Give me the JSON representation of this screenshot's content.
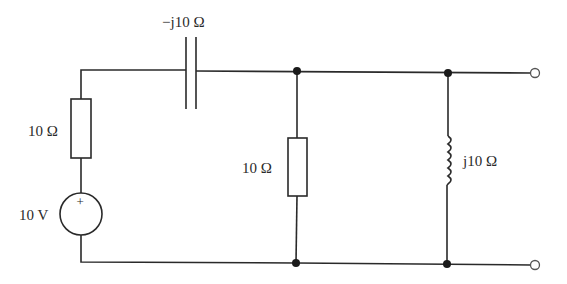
{
  "diagram": {
    "type": "circuit-schematic",
    "components": {
      "source": {
        "kind": "voltage-source",
        "label": "10 V",
        "polarity": "+"
      },
      "series_resistor": {
        "kind": "resistor",
        "label": "10 Ω"
      },
      "capacitor": {
        "kind": "capacitor",
        "label": "−j10 Ω"
      },
      "shunt_resistor": {
        "kind": "resistor",
        "label": "10 Ω"
      },
      "inductor": {
        "kind": "inductor",
        "label": "j10 Ω"
      }
    },
    "terminals": {
      "count": 2,
      "style": "open-circle"
    },
    "nodes": {
      "count": 4,
      "style": "filled-dot"
    }
  }
}
